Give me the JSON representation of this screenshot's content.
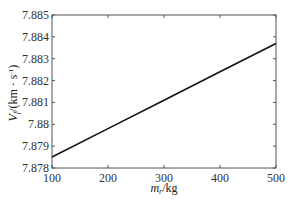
{
  "chart_data": {
    "type": "line",
    "title": "",
    "xlabel": "m_r/kg",
    "xlabel_main": "m",
    "xlabel_sub": "r",
    "xlabel_unit": "/kg",
    "ylabel": "V_f/(km·s⁻¹)",
    "ylabel_main": "V",
    "ylabel_sub": "f",
    "ylabel_unit": "/(km · s",
    "ylabel_exp": "-1",
    "ylabel_close": ")",
    "xlim": [
      100,
      500
    ],
    "ylim": [
      7.878,
      7.885
    ],
    "xticks": [
      100,
      200,
      300,
      400,
      500
    ],
    "xtick_labels": [
      "100",
      "200",
      "300",
      "400",
      "500"
    ],
    "yticks": [
      7.878,
      7.879,
      7.88,
      7.881,
      7.882,
      7.883,
      7.884,
      7.885
    ],
    "ytick_labels": [
      "7.878",
      "7.879",
      "7.88",
      "7.881",
      "7.882",
      "7.883",
      "7.884",
      "7.885"
    ],
    "grid": false,
    "legend": null,
    "series": [
      {
        "name": "V_f",
        "x": [
          100,
          200,
          300,
          400,
          500
        ],
        "values": [
          7.8785,
          7.8798,
          7.8811,
          7.8824,
          7.8837
        ],
        "color": "#111111"
      }
    ]
  }
}
